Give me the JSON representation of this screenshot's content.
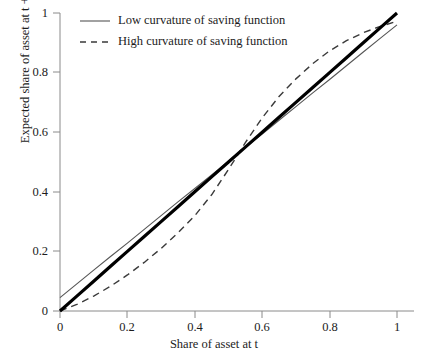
{
  "chart_data": {
    "type": "line",
    "title": "",
    "xlabel": "Share of asset at t",
    "ylabel": "Expected share of asset at t + 1",
    "xlim": [
      0,
      1
    ],
    "ylim": [
      0,
      1
    ],
    "grid": false,
    "legend_position": "top-left",
    "xticks": [
      "0",
      "0.2",
      "0.4",
      "0.6",
      "0.8",
      "1"
    ],
    "yticks": [
      "0",
      "0.2",
      "0.4",
      "0.6",
      "0.8",
      "1"
    ],
    "xtick_values": [
      0,
      0.2,
      0.4,
      0.6,
      0.8,
      1
    ],
    "ytick_values": [
      0,
      0.2,
      0.4,
      0.6,
      0.8,
      1
    ],
    "x": [
      0,
      0.05,
      0.1,
      0.15,
      0.2,
      0.25,
      0.3,
      0.35,
      0.4,
      0.45,
      0.5,
      0.55,
      0.6,
      0.65,
      0.7,
      0.75,
      0.8,
      0.85,
      0.9,
      0.95,
      1
    ],
    "series": [
      {
        "name": "45-degree line",
        "style": "solid-thick",
        "color": "#000000",
        "in_legend": false,
        "values": [
          0,
          0.05,
          0.1,
          0.15,
          0.2,
          0.25,
          0.3,
          0.35,
          0.4,
          0.45,
          0.5,
          0.55,
          0.6,
          0.65,
          0.7,
          0.75,
          0.8,
          0.85,
          0.9,
          0.95,
          1
        ]
      },
      {
        "name": "Low curvature of saving function",
        "style": "solid-thin",
        "color": "#555555",
        "in_legend": true,
        "values": [
          0.045,
          0.091,
          0.137,
          0.183,
          0.228,
          0.274,
          0.32,
          0.366,
          0.411,
          0.457,
          0.503,
          0.549,
          0.594,
          0.64,
          0.686,
          0.732,
          0.777,
          0.823,
          0.869,
          0.915,
          0.96
        ]
      },
      {
        "name": "High curvature of saving function",
        "style": "dashed",
        "color": "#3a3a3a",
        "in_legend": true,
        "values": [
          0.0,
          0.022,
          0.05,
          0.083,
          0.121,
          0.163,
          0.21,
          0.262,
          0.32,
          0.39,
          0.475,
          0.565,
          0.648,
          0.72,
          0.779,
          0.83,
          0.873,
          0.907,
          0.934,
          0.955,
          0.972
        ]
      }
    ],
    "annotations": []
  },
  "legend": {
    "items": [
      {
        "label": "Low curvature of saving function",
        "style": "solid-thin"
      },
      {
        "label": "High curvature of saving function",
        "style": "dashed"
      }
    ]
  },
  "axes": {
    "x_title": "Share of asset at t",
    "y_title": "Expected share of asset at t + 1"
  },
  "colors": {
    "axis": "#8a8a8a",
    "thick_line": "#000000",
    "thin_line": "#555555",
    "dashed_line": "#3a3a3a",
    "text": "#1c1c1c",
    "background": "#ffffff"
  }
}
